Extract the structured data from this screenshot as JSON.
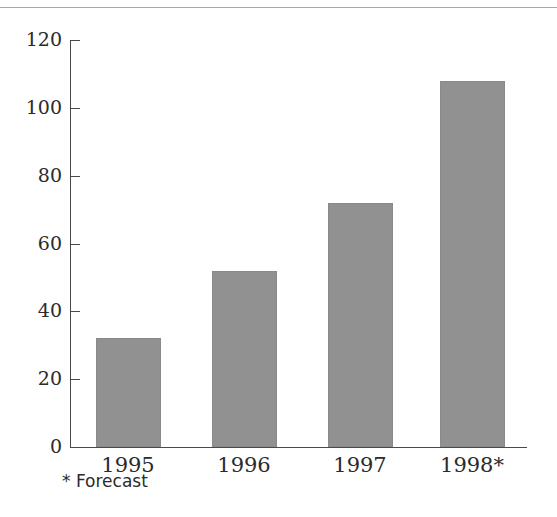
{
  "chart_data": {
    "type": "bar",
    "title": "",
    "subtitle": "",
    "xlabel": "",
    "ylabel": "",
    "categories": [
      "1995",
      "1996",
      "1997",
      "1998*"
    ],
    "values": [
      32,
      52,
      72,
      108
    ],
    "ylim": [
      0,
      120
    ],
    "yticks": [
      0,
      20,
      40,
      60,
      80,
      100,
      120
    ],
    "ytick_labels": [
      "0",
      "20",
      "40",
      "60",
      "80",
      "100",
      "120"
    ],
    "grid": false,
    "legend": null,
    "annotations": [
      "* Forecast"
    ],
    "series": [
      {
        "name": "",
        "values": [
          32,
          52,
          72,
          108
        ]
      }
    ]
  },
  "figure": {
    "footnote": "* Forecast",
    "bar_color": "#919191",
    "axis_color": "#4a4a4a",
    "text_color": "#2b2b2b",
    "rule_color": "#a8a8a8",
    "background": "#ffffff"
  },
  "axis": {
    "y_labels": [
      "120",
      "100",
      "80",
      "60",
      "40",
      "20",
      "0"
    ],
    "x_labels": [
      "1995",
      "1996",
      "1997",
      "1998*"
    ]
  }
}
